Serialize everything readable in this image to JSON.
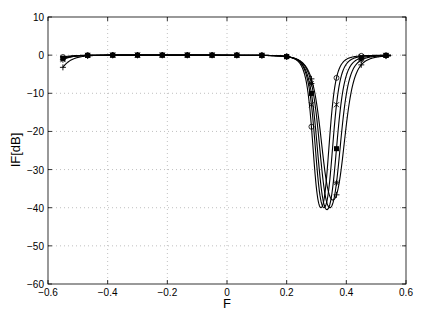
{
  "chart_data": {
    "type": "line",
    "title": "",
    "xlabel": "F",
    "ylabel": "IF[dB]",
    "xlim": [
      -0.6,
      0.6
    ],
    "ylim": [
      -60,
      10
    ],
    "xticks": [
      -0.6,
      -0.4,
      -0.2,
      0,
      0.2,
      0.4,
      0.6
    ],
    "xtick_labels": [
      "-0.6",
      "-0.4",
      "-0.2",
      "0",
      "0.2",
      "0.4",
      "0.6"
    ],
    "yticks": [
      10,
      0,
      -10,
      -20,
      -30,
      -40,
      -50,
      -60
    ],
    "ytick_labels": [
      "10",
      "0",
      "-10",
      "-20",
      "-30",
      "-40",
      "-50",
      "-60"
    ],
    "grid": true,
    "legend": null,
    "series": [
      {
        "name": "curve-o",
        "marker": "o",
        "notch_center": 0.315,
        "notch_depth": -40,
        "notch_width": 0.035,
        "edge_drop": -0.5
      },
      {
        "name": "curve-x",
        "marker": "x",
        "notch_center": 0.325,
        "notch_depth": -40,
        "notch_width": 0.038,
        "edge_drop": -1.0
      },
      {
        "name": "curve-square",
        "marker": "s",
        "notch_center": 0.335,
        "notch_depth": -40.5,
        "notch_width": 0.042,
        "edge_drop": -0.8
      },
      {
        "name": "curve-star",
        "marker": "*",
        "notch_center": 0.345,
        "notch_depth": -40,
        "notch_width": 0.045,
        "edge_drop": -1.2
      },
      {
        "name": "curve-plus",
        "marker": "+",
        "notch_center": 0.355,
        "notch_depth": -38,
        "notch_width": 0.05,
        "edge_drop": -3.2
      }
    ],
    "x_range": [
      -0.55,
      0.55
    ],
    "marker_x": [
      -0.55,
      -0.467,
      -0.383,
      -0.3,
      -0.217,
      -0.133,
      -0.05,
      0.033,
      0.117,
      0.2,
      0.283,
      0.367,
      0.45,
      0.533
    ]
  }
}
